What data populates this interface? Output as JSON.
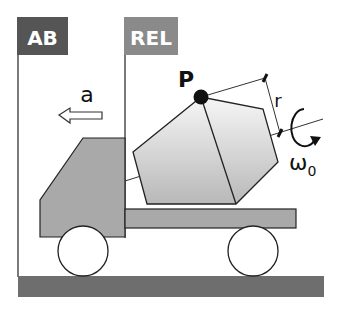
{
  "diagram": {
    "frames": {
      "absolute": {
        "label": "AB",
        "color": "#555555"
      },
      "relative": {
        "label": "REL",
        "color": "#8a8a8a"
      }
    },
    "acceleration": {
      "label": "a"
    },
    "point": {
      "label": "P"
    },
    "radius": {
      "label": "r"
    },
    "angular_velocity": {
      "label": "ω",
      "subscript": "0"
    },
    "colors": {
      "truck_body": "#a9a9a9",
      "ground": "#6e6e6e",
      "drum_light": "#f4f4f4",
      "drum_dark": "#bdbdbd",
      "stroke": "#222222"
    }
  }
}
